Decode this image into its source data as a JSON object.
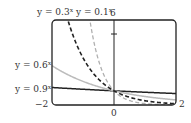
{
  "chart_data": {
    "type": "line",
    "title": "",
    "xlabel": "",
    "ylabel": "",
    "xlim": [
      -2,
      2
    ],
    "ylim": [
      0,
      6
    ],
    "grid": false,
    "legend_position": "inline labels",
    "x_tick_labels": [
      "-2",
      "0",
      "2"
    ],
    "y_tick_labels": [
      "6"
    ],
    "y_ticks": [
      5
    ],
    "series": [
      {
        "name": "y = 0.3^x",
        "base": 0.3,
        "style": "dashed",
        "color": "#222222",
        "label_position": "top"
      },
      {
        "name": "y = 0.1^x",
        "base": 0.1,
        "style": "dashed",
        "color": "#b0b0b0",
        "label_position": "top"
      },
      {
        "name": "y = 0.6^x",
        "base": 0.6,
        "style": "solid",
        "color": "#bbbbbb",
        "label_position": "left"
      },
      {
        "name": "y = 0.9^x",
        "base": 0.9,
        "style": "solid",
        "color": "#222222",
        "label_position": "left"
      }
    ],
    "sample_points": {
      "x": [
        -2,
        -1,
        0,
        1,
        2
      ],
      "y = 0.3^x": [
        11.11,
        3.33,
        1,
        0.3,
        0.09
      ],
      "y = 0.1^x": [
        100,
        10,
        1,
        0.1,
        0.01
      ],
      "y = 0.6^x": [
        2.78,
        1.67,
        1,
        0.6,
        0.36
      ],
      "y = 0.9^x": [
        1.23,
        1.11,
        1,
        0.9,
        0.81
      ]
    }
  },
  "labels": {
    "label_03_base": "y = 0.3",
    "label_01_base": "y = 0.1",
    "label_06_base": "y = 0.6",
    "label_09_base": "y = 0.9",
    "exp": "x",
    "ytop": "6",
    "xmin": "−2",
    "xzero": "0",
    "xmax": "2"
  }
}
